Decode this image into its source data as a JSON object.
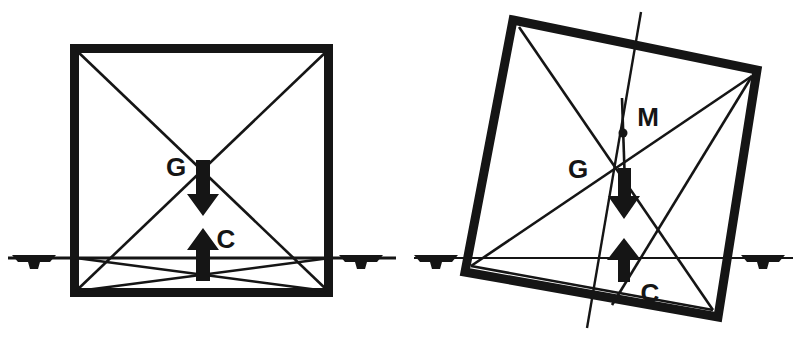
{
  "figure": {
    "background_color": "#ffffff",
    "ink_color": "#151515",
    "width": 799,
    "height": 339,
    "panels": [
      {
        "name": "upright-condition",
        "description": "Upright rectangular hull section resting at the waterline",
        "hull": {
          "shape": "square",
          "stroke_width": 9,
          "corners": [
            {
              "x": 70,
              "y": 44
            },
            {
              "x": 333,
              "y": 44
            },
            {
              "x": 333,
              "y": 297
            },
            {
              "x": 70,
              "y": 297
            }
          ]
        },
        "waterline": {
          "y": 258,
          "x1": 8,
          "x2": 396,
          "stroke_width": 3
        },
        "water_supports": [
          {
            "name": "water-support-left",
            "x": 32,
            "y": 258
          },
          {
            "name": "water-support-right",
            "x": 359,
            "y": 258
          }
        ],
        "diagonals": [
          {
            "name": "diagonal-top-left-to-bottom-right",
            "x1": 76,
            "y1": 50,
            "x2": 328,
            "y2": 291
          },
          {
            "name": "diagonal-top-right-to-bottom-left",
            "x1": 328,
            "y1": 50,
            "x2": 76,
            "y2": 291
          },
          {
            "name": "waterplane-chord-left",
            "x1": 76,
            "y1": 291,
            "x2": 328,
            "y2": 258
          },
          {
            "name": "waterplane-chord-right",
            "x1": 328,
            "y1": 291,
            "x2": 76,
            "y2": 258
          }
        ],
        "points": [
          {
            "id": "G",
            "label": "G",
            "meaning": "centre of gravity",
            "x": 203,
            "y": 164,
            "label_x": 176,
            "label_y": 176,
            "arrow": {
              "direction": "down",
              "from_y": 164,
              "to_y": 212
            }
          },
          {
            "id": "C",
            "label": "C",
            "meaning": "centre of buoyancy",
            "x": 203,
            "y": 270,
            "label_x": 224,
            "label_y": 248,
            "arrow": {
              "direction": "up",
              "from_y": 277,
              "to_y": 228
            }
          }
        ]
      },
      {
        "name": "heeled-condition",
        "description": "Hull section heeled to starboard showing metacentre M above G",
        "hull": {
          "shape": "square",
          "stroke_width": 9,
          "corners": [
            {
              "x": 513,
              "y": 20
            },
            {
              "x": 757,
              "y": 70
            },
            {
              "x": 718,
              "y": 317
            },
            {
              "x": 465,
              "y": 272
            }
          ]
        },
        "waterline": {
          "y": 258,
          "x1": 414,
          "x2": 793,
          "stroke_width": 2
        },
        "water_supports": [
          {
            "name": "water-support-left",
            "x": 434,
            "y": 258
          },
          {
            "name": "water-support-right",
            "x": 761,
            "y": 258
          }
        ],
        "diagonals": [
          {
            "name": "diagonal-top-left-to-bottom-right",
            "x1": 519,
            "y1": 27,
            "x2": 713,
            "y2": 310
          },
          {
            "name": "diagonal-top-right-to-bottom-left",
            "x1": 752,
            "y1": 76,
            "x2": 471,
            "y2": 266
          },
          {
            "name": "waterplane-chord-left",
            "x1": 471,
            "y1": 266,
            "x2": 713,
            "y2": 310
          },
          {
            "name": "waterplane-chord-right",
            "x1": 752,
            "y1": 76,
            "x2": 612,
            "y2": 305
          }
        ],
        "centreline": {
          "name": "hull-centreline",
          "x1": 639,
          "y1": 14,
          "x2": 588,
          "y2": 327
        },
        "vertical_line": {
          "name": "vertical-through-metacentre",
          "x1": 623,
          "y1": 98,
          "x2": 625,
          "y2": 214
        },
        "points": [
          {
            "id": "M",
            "label": "M",
            "meaning": "metacentre",
            "x": 622,
            "y": 133,
            "label_x": 640,
            "label_y": 122,
            "dot_radius": 4
          },
          {
            "id": "G",
            "label": "G",
            "meaning": "centre of gravity",
            "x": 606,
            "y": 178,
            "label_x": 575,
            "label_y": 176,
            "arrow": {
              "direction": "down",
              "from_y": 170,
              "to_y": 216
            }
          },
          {
            "id": "C",
            "label": "C",
            "meaning": "centre of buoyancy",
            "x": 622,
            "y": 272,
            "label_x": 645,
            "label_y": 298,
            "arrow": {
              "direction": "up",
              "from_y": 278,
              "to_y": 240
            }
          }
        ]
      }
    ],
    "legend_keys": [
      {
        "symbol": "G",
        "meaning": "centre of gravity"
      },
      {
        "symbol": "C",
        "meaning": "centre of buoyancy"
      },
      {
        "symbol": "M",
        "meaning": "metacentre"
      }
    ]
  }
}
